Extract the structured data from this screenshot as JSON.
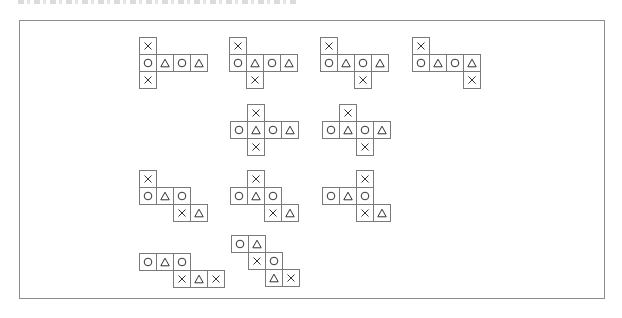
{
  "figure": {
    "cell_size": 18,
    "symbols": {
      "O": "circle",
      "T": "triangle",
      "X": "cross"
    },
    "nets": [
      {
        "id": 1,
        "x": 139,
        "y": 37,
        "cells": [
          [
            0,
            0,
            "X"
          ],
          [
            0,
            1,
            "O"
          ],
          [
            1,
            1,
            "T"
          ],
          [
            2,
            1,
            "O"
          ],
          [
            3,
            1,
            "T"
          ],
          [
            0,
            2,
            "X"
          ]
        ]
      },
      {
        "id": 2,
        "x": 229,
        "y": 37,
        "cells": [
          [
            0,
            0,
            "X"
          ],
          [
            0,
            1,
            "O"
          ],
          [
            1,
            1,
            "T"
          ],
          [
            2,
            1,
            "O"
          ],
          [
            3,
            1,
            "T"
          ],
          [
            1,
            2,
            "X"
          ]
        ]
      },
      {
        "id": 3,
        "x": 320,
        "y": 37,
        "cells": [
          [
            0,
            0,
            "X"
          ],
          [
            0,
            1,
            "O"
          ],
          [
            1,
            1,
            "T"
          ],
          [
            2,
            1,
            "O"
          ],
          [
            3,
            1,
            "T"
          ],
          [
            2,
            2,
            "X"
          ]
        ]
      },
      {
        "id": 4,
        "x": 412,
        "y": 37,
        "cells": [
          [
            0,
            0,
            "X"
          ],
          [
            0,
            1,
            "O"
          ],
          [
            1,
            1,
            "T"
          ],
          [
            2,
            1,
            "O"
          ],
          [
            3,
            1,
            "T"
          ],
          [
            3,
            2,
            "X"
          ]
        ]
      },
      {
        "id": 5,
        "x": 230,
        "y": 104,
        "cells": [
          [
            1,
            0,
            "X"
          ],
          [
            0,
            1,
            "O"
          ],
          [
            1,
            1,
            "T"
          ],
          [
            2,
            1,
            "O"
          ],
          [
            3,
            1,
            "T"
          ],
          [
            1,
            2,
            "X"
          ]
        ]
      },
      {
        "id": 6,
        "x": 322,
        "y": 104,
        "cells": [
          [
            1,
            0,
            "X"
          ],
          [
            0,
            1,
            "O"
          ],
          [
            1,
            1,
            "T"
          ],
          [
            2,
            1,
            "O"
          ],
          [
            3,
            1,
            "T"
          ],
          [
            2,
            2,
            "X"
          ]
        ]
      },
      {
        "id": 7,
        "x": 139,
        "y": 170,
        "cells": [
          [
            0,
            0,
            "X"
          ],
          [
            0,
            1,
            "O"
          ],
          [
            1,
            1,
            "T"
          ],
          [
            2,
            1,
            "O"
          ],
          [
            2,
            2,
            "X"
          ],
          [
            3,
            2,
            "T"
          ]
        ]
      },
      {
        "id": 8,
        "x": 230,
        "y": 170,
        "cells": [
          [
            1,
            0,
            "X"
          ],
          [
            0,
            1,
            "O"
          ],
          [
            1,
            1,
            "T"
          ],
          [
            2,
            1,
            "O"
          ],
          [
            2,
            2,
            "X"
          ],
          [
            3,
            2,
            "T"
          ]
        ]
      },
      {
        "id": 9,
        "x": 322,
        "y": 170,
        "cells": [
          [
            2,
            0,
            "X"
          ],
          [
            0,
            1,
            "O"
          ],
          [
            1,
            1,
            "T"
          ],
          [
            2,
            1,
            "O"
          ],
          [
            2,
            2,
            "X"
          ],
          [
            3,
            2,
            "T"
          ]
        ]
      },
      {
        "id": 10,
        "x": 139,
        "y": 253,
        "cells": [
          [
            0,
            0,
            "O"
          ],
          [
            1,
            0,
            "T"
          ],
          [
            2,
            0,
            "O"
          ],
          [
            2,
            1,
            "X"
          ],
          [
            3,
            1,
            "T"
          ],
          [
            4,
            1,
            "X"
          ]
        ]
      },
      {
        "id": 11,
        "x": 231,
        "y": 235,
        "cells": [
          [
            0,
            0,
            "O"
          ],
          [
            1,
            0,
            "T"
          ],
          [
            1,
            1,
            "X"
          ],
          [
            2,
            1,
            "O"
          ],
          [
            2,
            2,
            "T"
          ],
          [
            3,
            2,
            "X"
          ]
        ]
      }
    ]
  },
  "colors": {
    "border": "#7a7a7a",
    "frame": "#8c8c8c",
    "symbol": "#333333"
  }
}
